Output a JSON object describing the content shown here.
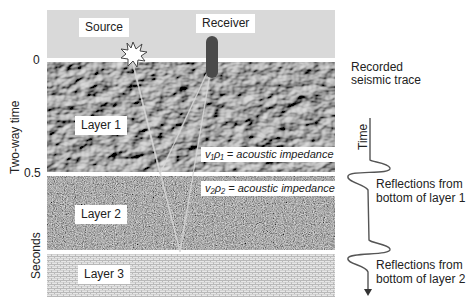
{
  "diagram": {
    "labels": {
      "source": "Source",
      "receiver": "Receiver",
      "layer1": "Layer 1",
      "layer2": "Layer 2",
      "layer3": "Layer 3"
    },
    "impedance": {
      "layer1_symbol": "v₁ρ₁",
      "layer1_text": " = acoustic impedance",
      "layer2_symbol": "v₂ρ₂",
      "layer2_text": " = acoustic impedance"
    },
    "axis": {
      "title_top": "Two-way time",
      "title_bottom": "Seconds",
      "ticks": [
        "0",
        "0.5"
      ]
    },
    "trace": {
      "title_line1": "Recorded",
      "title_line2": "seismic trace",
      "time_label": "Time",
      "reflection1_line1": "Reflections from",
      "reflection1_line2": "bottom of layer 1",
      "reflection2_line1": "Reflections from",
      "reflection2_line2": "bottom of layer 2"
    },
    "colors": {
      "air": "#d9d9d9",
      "layer1": "#6e6e6e",
      "layer2": "#7a7a7a",
      "layer3": "#dcdcdc",
      "receiver": "#4a4a4a",
      "trace": "#555555"
    }
  }
}
